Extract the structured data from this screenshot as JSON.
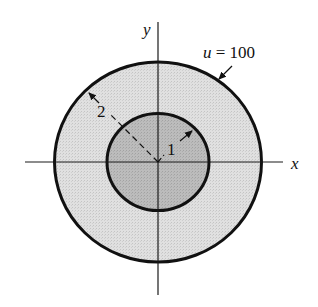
{
  "figure": {
    "width": 318,
    "height": 307,
    "background": "#ffffff",
    "center": {
      "x": 158,
      "y": 162
    }
  },
  "axes": {
    "x": {
      "label": "x",
      "from": 25,
      "to": 283
    },
    "y": {
      "label": "y",
      "from": 22,
      "to": 295
    },
    "color": "#1a1a1a"
  },
  "regions": {
    "outer": {
      "rx": 103.5,
      "ry": 100,
      "fill": "#dcdcdc",
      "stroke": "#111111",
      "stroke_width": 3
    },
    "inner": {
      "rx": 51,
      "ry": 48.5,
      "fill": "#b9b9b9",
      "stroke": "#111111",
      "stroke_width": 3
    }
  },
  "annotations": {
    "boundary_condition": {
      "var": "u",
      "eq": " = 100",
      "text": "u = 100",
      "arrow_from": {
        "x": 232,
        "y": 67
      },
      "arrow_to": {
        "x": 218,
        "y": 80
      }
    },
    "outer_radius": {
      "label": "2",
      "value": 2
    },
    "inner_radius": {
      "label": "1",
      "value": 1
    }
  }
}
